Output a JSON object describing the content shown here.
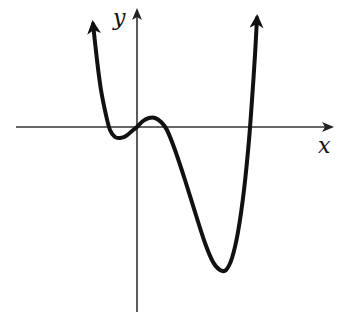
{
  "chart_data": {
    "type": "line",
    "title": "",
    "xlabel": "x",
    "ylabel": "y",
    "grid": false,
    "ticks": false,
    "features": {
      "end_behavior": "up on both ends",
      "x_intercepts_relative": [
        "negative small",
        "0",
        "positive small",
        "positive large"
      ],
      "local_min_left": {
        "x_px": 120,
        "y_px": 138
      },
      "origin": {
        "x_px": 137,
        "y_px": 127
      },
      "local_max": {
        "x_px": 153,
        "y_px": 118
      },
      "global_min": {
        "x_px": 223,
        "y_px": 270
      }
    },
    "curve_points_px": [
      [
        93,
        24
      ],
      [
        97,
        60
      ],
      [
        101,
        90
      ],
      [
        106,
        115
      ],
      [
        110,
        130
      ],
      [
        115,
        137
      ],
      [
        120,
        138
      ],
      [
        126,
        136
      ],
      [
        132,
        131
      ],
      [
        137,
        127
      ],
      [
        143,
        121
      ],
      [
        149,
        118
      ],
      [
        155,
        118
      ],
      [
        161,
        122
      ],
      [
        167,
        130
      ],
      [
        175,
        150
      ],
      [
        185,
        180
      ],
      [
        195,
        212
      ],
      [
        205,
        243
      ],
      [
        213,
        262
      ],
      [
        220,
        270
      ],
      [
        226,
        270
      ],
      [
        232,
        258
      ],
      [
        238,
        232
      ],
      [
        244,
        190
      ],
      [
        249,
        140
      ],
      [
        252,
        100
      ],
      [
        255,
        55
      ],
      [
        257,
        18
      ]
    ]
  },
  "labels": {
    "x_axis": "x",
    "y_axis": "y"
  },
  "colors": {
    "curve": "#111111",
    "axes": "#333333",
    "background": "#ffffff"
  }
}
